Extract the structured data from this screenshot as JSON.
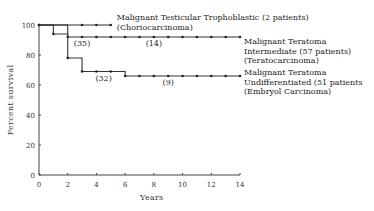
{
  "chart_data": {
    "type": "line",
    "subtype": "kaplan-meier-step",
    "title": "",
    "xlabel": "Years",
    "ylabel": "Percent survival",
    "xlim": [
      0,
      14
    ],
    "ylim": [
      0,
      100
    ],
    "xticks": [
      0,
      2,
      4,
      6,
      8,
      10,
      12,
      14
    ],
    "yticks": [
      0,
      20,
      40,
      60,
      80,
      100
    ],
    "grid": false,
    "legend_position": "inline-right",
    "series": [
      {
        "name": "Malignant Testicular Trophoblastic (2 patients) (Choriocarcinoma)",
        "label_lines": [
          "Malignant Testicular Trophoblastic (2 patients)",
          "(Choriocarcinoma)"
        ],
        "steps": [
          [
            0,
            100
          ],
          [
            5,
            100
          ]
        ],
        "markers_x": [
          0,
          3,
          4,
          5
        ],
        "annotations": []
      },
      {
        "name": "Malignant Teratoma Intermediate (57 patients) (Teratocarcinoma)",
        "label_lines": [
          "Malignant Teratoma",
          "Intermediate (57 patients)",
          "(Teratocarcinoma)"
        ],
        "steps": [
          [
            0,
            100
          ],
          [
            1,
            100
          ],
          [
            1,
            94
          ],
          [
            2,
            94
          ],
          [
            2,
            92
          ],
          [
            14,
            92
          ]
        ],
        "markers_x": [
          0,
          1,
          2,
          3,
          4,
          5,
          6,
          7,
          8,
          9,
          10,
          11,
          12,
          13,
          14
        ],
        "annotations": [
          {
            "x": 3,
            "text": "(35)"
          },
          {
            "x": 8,
            "text": "(14)"
          }
        ]
      },
      {
        "name": "Malignant Teratoma Undifferentiated (51 patients) (Embryol Carcinoma)",
        "label_lines": [
          "Malignant Teratoma",
          "Undifferentiated (51 patients",
          "(Embryol Carcinoma)"
        ],
        "steps": [
          [
            0,
            100
          ],
          [
            2,
            100
          ],
          [
            2,
            78
          ],
          [
            3,
            78
          ],
          [
            3,
            69
          ],
          [
            6,
            69
          ],
          [
            6,
            66
          ],
          [
            14,
            66
          ]
        ],
        "markers_x": [
          2,
          3,
          4,
          5,
          6,
          7,
          8,
          9,
          10,
          11,
          12,
          13,
          14
        ],
        "annotations": [
          {
            "x": 4.5,
            "text": "(32)"
          },
          {
            "x": 9,
            "text": "(9)"
          }
        ]
      }
    ]
  },
  "axes": {
    "xlabel": "Years",
    "ylabel": "Percent survival"
  }
}
